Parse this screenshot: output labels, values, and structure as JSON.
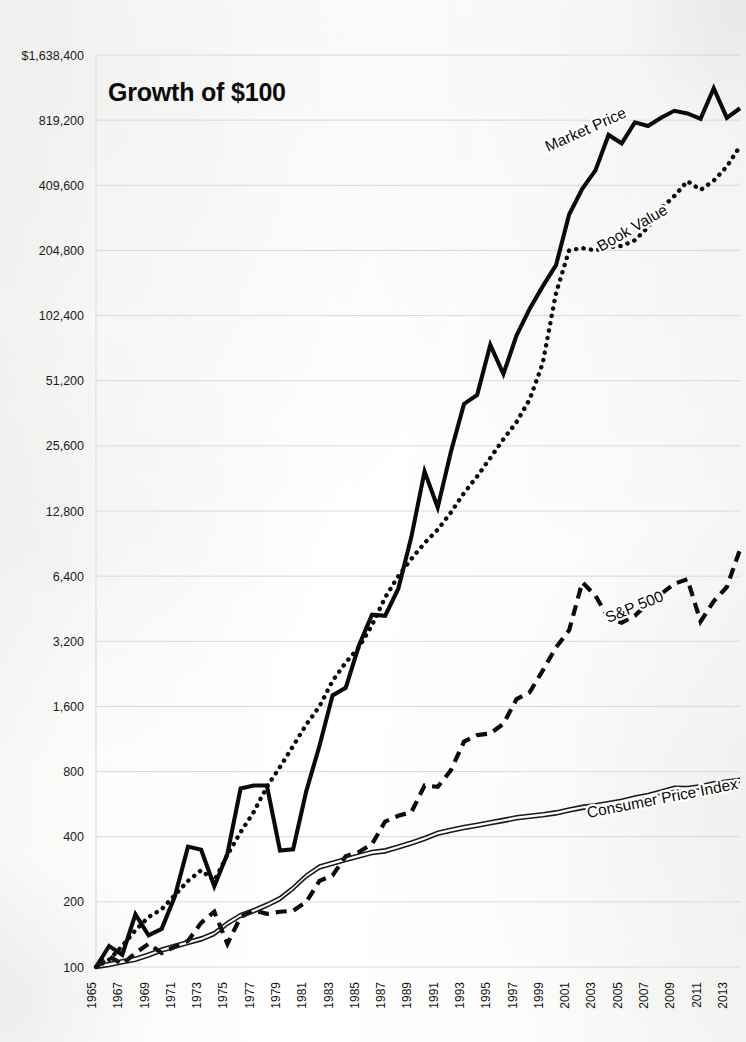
{
  "title": "Growth of $100",
  "chart_data": {
    "type": "line",
    "title": "Growth of $100",
    "xlabel": "",
    "ylabel": "",
    "scale": "log2",
    "grid": true,
    "legend": "inline-labels",
    "ylim": [
      100,
      1638400
    ],
    "ytick_labels": [
      "$1,638,400",
      "819,200",
      "409,600",
      "204,800",
      "102,400",
      "51,200",
      "25,600",
      "12,800",
      "6,400",
      "3,200",
      "1,600",
      "800",
      "400",
      "200",
      "100"
    ],
    "yticks": [
      1638400,
      819200,
      409600,
      204800,
      102400,
      51200,
      25600,
      12800,
      6400,
      3200,
      1600,
      800,
      400,
      200,
      100
    ],
    "xlim": [
      1965,
      2014
    ],
    "xtick_labels": [
      "1965",
      "1967",
      "1969",
      "1971",
      "1973",
      "1975",
      "1977",
      "1979",
      "1981",
      "1983",
      "1985",
      "1987",
      "1989",
      "1991",
      "1993",
      "1995",
      "1997",
      "1999",
      "2001",
      "2003",
      "2005",
      "2007",
      "2009",
      "2011",
      "2013"
    ],
    "xticks": [
      1965,
      1967,
      1969,
      1971,
      1973,
      1975,
      1977,
      1979,
      1981,
      1983,
      1985,
      1987,
      1989,
      1991,
      1993,
      1995,
      1997,
      1999,
      2001,
      2003,
      2005,
      2007,
      2009,
      2011,
      2013
    ],
    "x": [
      1965,
      1966,
      1967,
      1968,
      1969,
      1970,
      1971,
      1972,
      1973,
      1974,
      1975,
      1976,
      1977,
      1978,
      1979,
      1980,
      1981,
      1982,
      1983,
      1984,
      1985,
      1986,
      1987,
      1988,
      1989,
      1990,
      1991,
      1992,
      1993,
      1994,
      1995,
      1996,
      1997,
      1998,
      1999,
      2000,
      2001,
      2002,
      2003,
      2004,
      2005,
      2006,
      2007,
      2008,
      2009,
      2010,
      2011,
      2012,
      2013,
      2014
    ],
    "series": [
      {
        "name": "Market Price",
        "style": "solid",
        "values": [
          100,
          125,
          114,
          175,
          140,
          150,
          212,
          360,
          348,
          236,
          334,
          668,
          690,
          690,
          345,
          350,
          650,
          1050,
          1800,
          1950,
          3050,
          4250,
          4200,
          5600,
          9750,
          19500,
          13300,
          24000,
          40000,
          44000,
          75000,
          55000,
          83000,
          110000,
          140000,
          175000,
          300000,
          395000,
          480000,
          700000,
          640000,
          800000,
          770000,
          840000,
          905000,
          880000,
          830000,
          1150000,
          840000,
          930000
        ]
      },
      {
        "name": "Book Value",
        "style": "dotted",
        "values": [
          100,
          108,
          125,
          148,
          170,
          185,
          215,
          250,
          280,
          250,
          330,
          420,
          520,
          680,
          840,
          1050,
          1320,
          1600,
          2100,
          2550,
          3000,
          3800,
          5100,
          6400,
          7700,
          9100,
          10500,
          12600,
          15500,
          18500,
          22500,
          27500,
          33000,
          42000,
          62000,
          130000,
          205000,
          210000,
          205000,
          212000,
          215000,
          228000,
          262000,
          320000,
          365000,
          428000,
          390000,
          430000,
          500000,
          620000
        ]
      },
      {
        "name": "S&P 500",
        "style": "dashed",
        "values": [
          100,
          112,
          103,
          116,
          128,
          116,
          124,
          132,
          160,
          180,
          128,
          170,
          183,
          176,
          180,
          182,
          200,
          250,
          265,
          325,
          340,
          370,
          470,
          500,
          520,
          690,
          680,
          810,
          1100,
          1180,
          1200,
          1330,
          1730,
          1860,
          2350,
          3000,
          3600,
          6000,
          5200,
          4100,
          3900,
          4200,
          4800,
          5300,
          5900,
          6200,
          3950,
          4900,
          5700,
          8500
        ]
      },
      {
        "name": "Consumer Price Index",
        "style": "double-thin",
        "values": [
          100,
          102,
          105,
          108,
          113,
          119,
          124,
          129,
          134,
          142,
          158,
          172,
          181,
          192,
          206,
          230,
          262,
          288,
          300,
          312,
          324,
          336,
          342,
          356,
          372,
          390,
          412,
          426,
          438,
          449,
          461,
          473,
          486,
          494,
          502,
          512,
          528,
          543,
          553,
          566,
          580,
          600,
          616,
          640,
          666,
          664,
          676,
          698,
          712,
          725
        ]
      }
    ],
    "series_endpoints": {
      "market_price_final": 1638400,
      "book_value_final": 780000,
      "sp500_final": 11000,
      "cpi_final": 760
    }
  }
}
